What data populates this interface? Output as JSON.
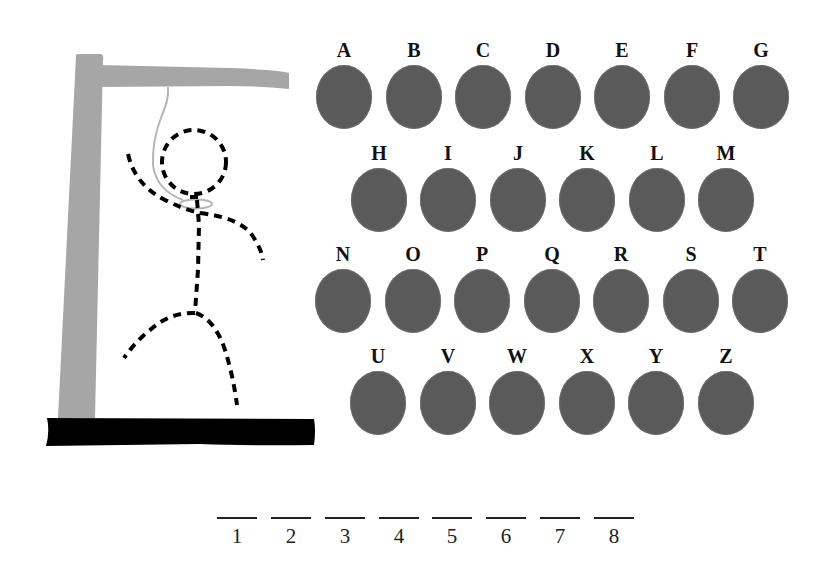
{
  "game": {
    "title": "Hangman",
    "colors": {
      "gallows": "#a6a6a6",
      "base": "#000000",
      "rope": "#b5b5b5",
      "figure": "#000000",
      "key_disc": "#5a5a5a",
      "text": "#111111"
    }
  },
  "keyboard": {
    "rows": [
      [
        "A",
        "B",
        "C",
        "D",
        "E",
        "F",
        "G"
      ],
      [
        "H",
        "I",
        "J",
        "K",
        "L",
        "M"
      ],
      [
        "N",
        "O",
        "P",
        "Q",
        "R",
        "S",
        "T"
      ],
      [
        "U",
        "V",
        "W",
        "X",
        "Y",
        "Z"
      ]
    ]
  },
  "word_slots": {
    "count": 8,
    "labels": [
      "1",
      "2",
      "3",
      "4",
      "5",
      "6",
      "7",
      "8"
    ]
  }
}
